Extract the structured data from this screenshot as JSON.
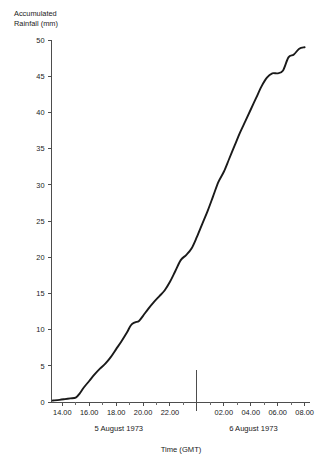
{
  "chart_data": {
    "type": "line",
    "title": "",
    "xlabel": "Time (GMT)",
    "ylabel_line1": "Accumulated",
    "ylabel_line2": "Rainfall (mm)",
    "ylabel": "Accumulated Rainfall (mm)",
    "ylim": [
      0,
      50
    ],
    "ytick_values": [
      0,
      5,
      10,
      15,
      20,
      25,
      30,
      35,
      40,
      45,
      50
    ],
    "ytick_labels": [
      "0",
      "5",
      "10",
      "15",
      "20",
      "25",
      "30",
      "35",
      "40",
      "45",
      "50"
    ],
    "xlim_hours": [
      13.2,
      8.4
    ],
    "xtick_hours": [
      14,
      16,
      18,
      20,
      22,
      0,
      2,
      4,
      6,
      8
    ],
    "xtick_labels": [
      "14.00",
      "16.00",
      "18.00",
      "20.00",
      "22.00",
      "",
      "02.00",
      "04.00",
      "06.00",
      "08.00"
    ],
    "xminor_step_hours": 1,
    "day_separator_hour": 0,
    "day_labels": [
      {
        "text": "5 August 1973",
        "center_hour": 18.2
      },
      {
        "text": "6 August 1973",
        "center_hour": 4.2
      }
    ],
    "grid": false,
    "legend": null,
    "series": [
      {
        "name": "Accumulated rainfall",
        "color": "#1a1a1a",
        "x_hours": [
          13.3,
          13.8,
          14.2,
          14.6,
          15.0,
          15.3,
          15.6,
          16.0,
          16.4,
          16.8,
          17.2,
          17.6,
          18.0,
          18.4,
          18.8,
          19.1,
          19.4,
          19.7,
          20.0,
          20.4,
          20.8,
          21.2,
          21.6,
          22.0,
          22.4,
          22.8,
          23.2,
          23.6,
          24.0,
          24.4,
          24.8,
          25.2,
          25.6,
          26.0,
          26.4,
          26.8,
          27.2,
          27.6,
          28.0,
          28.4,
          28.8,
          29.2,
          29.6,
          30.0,
          30.4,
          30.8,
          31.2,
          31.6,
          32.0
        ],
        "values": [
          0.2,
          0.3,
          0.4,
          0.5,
          0.6,
          1.2,
          2.0,
          2.9,
          3.8,
          4.6,
          5.3,
          6.2,
          7.3,
          8.4,
          9.6,
          10.6,
          11.0,
          11.2,
          11.9,
          12.9,
          13.8,
          14.6,
          15.4,
          16.6,
          18.1,
          19.6,
          20.3,
          21.2,
          22.8,
          24.6,
          26.4,
          28.4,
          30.4,
          31.8,
          33.6,
          35.4,
          37.2,
          38.8,
          40.4,
          42.0,
          43.6,
          44.8,
          45.4,
          45.4,
          45.8,
          47.6,
          48.0,
          48.8,
          49.0
        ]
      }
    ]
  },
  "chart_meta": {
    "background_color": "#ffffff",
    "axis_color": "#4d4d4d",
    "line_color": "#1a1a1a"
  }
}
